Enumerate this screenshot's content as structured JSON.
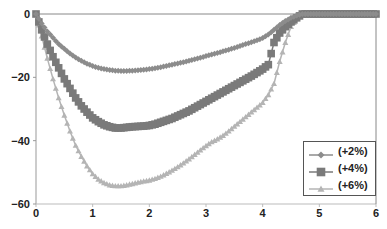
{
  "chart_data": {
    "type": "line",
    "title": "",
    "xlabel": "",
    "ylabel": "",
    "xlim": [
      0,
      6
    ],
    "ylim": [
      -60,
      0
    ],
    "x_ticks": [
      "0",
      "1",
      "2",
      "3",
      "4",
      "5",
      "6"
    ],
    "y_ticks": [
      "0",
      "-20",
      "-40",
      "-60"
    ],
    "grid": false,
    "legend_position": "lower right (inside)",
    "x": [
      0,
      0.1,
      0.2,
      0.3,
      0.4,
      0.5,
      0.6,
      0.7,
      0.8,
      0.9,
      1.0,
      1.1,
      1.2,
      1.3,
      1.4,
      1.5,
      1.6,
      1.7,
      1.8,
      1.9,
      2.0,
      2.1,
      2.2,
      2.3,
      2.4,
      2.5,
      2.6,
      2.7,
      2.8,
      2.9,
      3.0,
      3.1,
      3.2,
      3.3,
      3.4,
      3.5,
      3.6,
      3.7,
      3.8,
      3.9,
      4.0,
      4.1,
      4.2,
      4.3,
      4.4,
      4.5,
      4.6,
      4.7,
      4.8,
      4.9,
      5.0,
      5.1,
      5.2,
      5.3,
      5.4,
      5.5,
      5.6,
      5.7,
      5.8,
      5.9,
      6.0
    ],
    "series": [
      {
        "name": "(+2%)",
        "color": "#8c8c8c",
        "marker": "diamond",
        "values": [
          0,
          -3,
          -5.5,
          -7.5,
          -9.5,
          -11,
          -12.5,
          -13.7,
          -14.8,
          -15.7,
          -16.4,
          -17,
          -17.4,
          -17.7,
          -17.9,
          -18,
          -18,
          -17.9,
          -17.8,
          -17.6,
          -17.4,
          -17.1,
          -16.8,
          -16.4,
          -16,
          -15.6,
          -15.2,
          -14.8,
          -14.3,
          -13.8,
          -13.3,
          -12.8,
          -12.3,
          -11.8,
          -11.3,
          -10.7,
          -10.1,
          -9.5,
          -8.9,
          -8.3,
          -7.6,
          -6.5,
          -5,
          -3.5,
          -2.2,
          -1.2,
          -0.5,
          0,
          0,
          0,
          0,
          0,
          0,
          0,
          0,
          0,
          0,
          0,
          0,
          0,
          0
        ]
      },
      {
        "name": "(+4%)",
        "color": "#7a7a7a",
        "marker": "square",
        "values": [
          0,
          -5,
          -9.5,
          -13.5,
          -17,
          -20.5,
          -23.5,
          -26.5,
          -29,
          -31,
          -32.8,
          -34,
          -35,
          -35.6,
          -36,
          -36,
          -35.8,
          -35.6,
          -35.5,
          -35.4,
          -35.2,
          -34.8,
          -34.2,
          -33.6,
          -33,
          -32.2,
          -31.4,
          -30.6,
          -29.6,
          -28.6,
          -27.6,
          -26.6,
          -25.6,
          -24.6,
          -23.6,
          -22.6,
          -21.6,
          -20.6,
          -19.6,
          -18.5,
          -17.4,
          -16,
          -9,
          -6,
          -4,
          -2.5,
          -1.2,
          0,
          0,
          0,
          0,
          0,
          0,
          0,
          0,
          0,
          0,
          0,
          0,
          0,
          0
        ]
      },
      {
        "name": "(+6%)",
        "color": "#b4b4b4",
        "marker": "triangle",
        "values": [
          0,
          -7,
          -14,
          -20.5,
          -26.5,
          -32,
          -37,
          -41.5,
          -45,
          -48,
          -50.5,
          -52.2,
          -53.3,
          -54,
          -54.3,
          -54.3,
          -54,
          -53.6,
          -53.2,
          -52.8,
          -52.5,
          -52,
          -51.3,
          -50.4,
          -49.4,
          -48.3,
          -47.1,
          -45.8,
          -44.4,
          -43,
          -41.6,
          -40.4,
          -39.5,
          -38.4,
          -37,
          -35.5,
          -34,
          -32.5,
          -31,
          -29.5,
          -28,
          -25.5,
          -22,
          -15,
          -9,
          -4,
          -1.5,
          0,
          0,
          0,
          0,
          0,
          0,
          0,
          0,
          0,
          0,
          0,
          0,
          0,
          0
        ]
      }
    ]
  },
  "axes": {
    "x_labels": [
      "0",
      "1",
      "2",
      "3",
      "4",
      "5",
      "6"
    ],
    "y_labels": [
      "0",
      "-20",
      "-40",
      "-60"
    ]
  },
  "legend": {
    "items": [
      {
        "label": "(+2%)",
        "color": "#8c8c8c",
        "marker": "diamond"
      },
      {
        "label": "(+4%)",
        "color": "#7a7a7a",
        "marker": "square"
      },
      {
        "label": "(+6%)",
        "color": "#b4b4b4",
        "marker": "triangle"
      }
    ]
  }
}
